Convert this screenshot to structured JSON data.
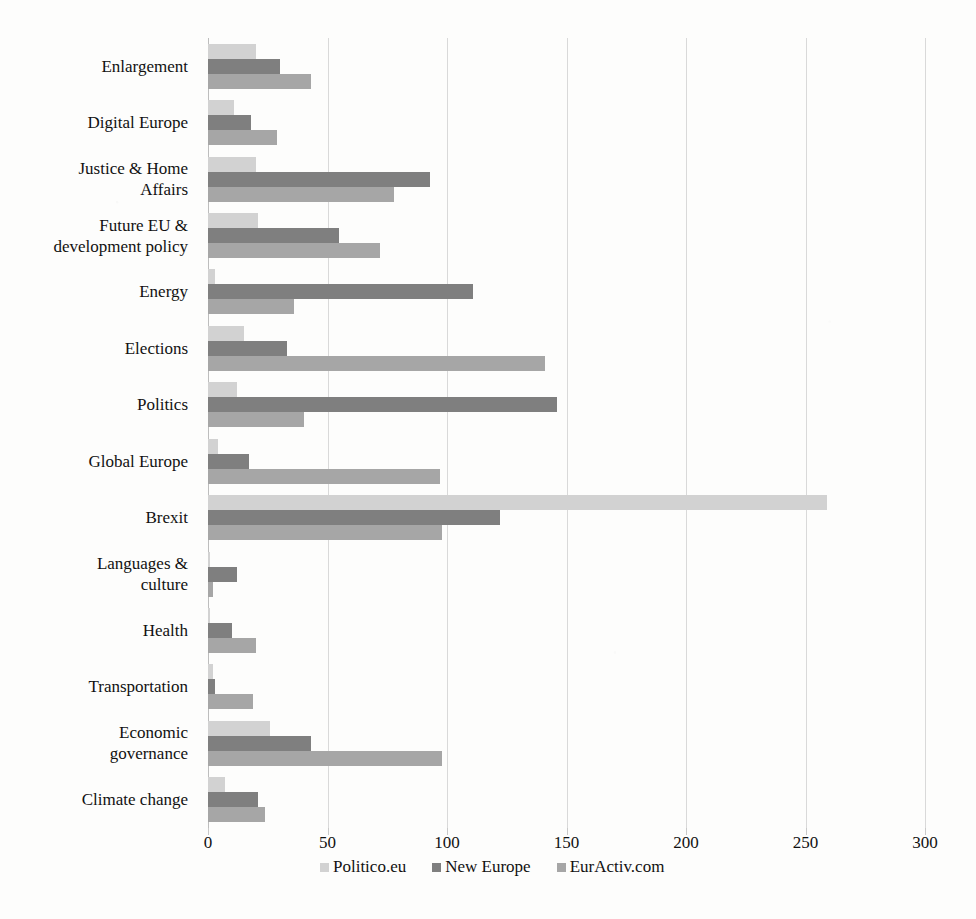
{
  "chart_data": {
    "type": "bar",
    "orientation": "horizontal",
    "title": "",
    "xlabel": "",
    "ylabel": "",
    "xlim": [
      0,
      300
    ],
    "xticks": [
      0,
      50,
      100,
      150,
      200,
      250,
      300
    ],
    "grid": true,
    "legend_position": "bottom",
    "categories": [
      "Enlargement",
      "Digital Europe",
      "Justice & Home Affairs",
      "Future EU & development policy",
      "Energy",
      "Elections",
      "Politics",
      "Global Europe",
      "Brexit",
      "Languages & culture",
      "Health",
      "Transportation",
      "Economic governance",
      "Climate change"
    ],
    "category_lines": [
      [
        "Enlargement"
      ],
      [
        "Digital Europe"
      ],
      [
        "Justice & Home",
        "Affairs"
      ],
      [
        "Future EU &",
        "development policy"
      ],
      [
        "Energy"
      ],
      [
        "Elections"
      ],
      [
        "Politics"
      ],
      [
        "Global Europe"
      ],
      [
        "Brexit"
      ],
      [
        "Languages &",
        "culture"
      ],
      [
        "Health"
      ],
      [
        "Transportation"
      ],
      [
        "Economic",
        "governance"
      ],
      [
        "Climate change"
      ]
    ],
    "series": [
      {
        "name": "Politico.eu",
        "color": "#d2d2d2",
        "values": [
          20,
          11,
          20,
          21,
          3,
          15,
          12,
          4,
          259,
          1,
          1,
          2,
          26,
          7
        ]
      },
      {
        "name": "New Europe",
        "color": "#7f7f7f",
        "values": [
          30,
          18,
          93,
          55,
          111,
          33,
          146,
          17,
          122,
          12,
          10,
          3,
          43,
          21
        ]
      },
      {
        "name": "EurActiv.com",
        "color": "#a6a6a6",
        "values": [
          43,
          29,
          78,
          72,
          36,
          141,
          40,
          97,
          98,
          2,
          20,
          19,
          98,
          24
        ]
      }
    ]
  }
}
